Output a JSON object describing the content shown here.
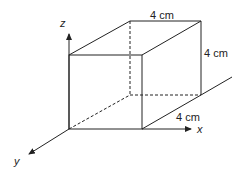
{
  "diagram": {
    "type": "cube-3d-axes",
    "labels": {
      "top_edge": "4 cm",
      "right_edge": "4 cm",
      "depth_edge": "4 cm",
      "x_axis": "x",
      "y_axis": "y",
      "z_axis": "z"
    },
    "colors": {
      "line": "#222222",
      "background": "#ffffff"
    }
  }
}
